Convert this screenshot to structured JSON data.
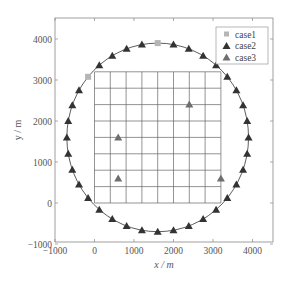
{
  "chart_data": {
    "type": "scatter",
    "title": "",
    "xlabel": "x / m",
    "ylabel": "y / m",
    "xlim": [
      -1000,
      4500
    ],
    "ylim": [
      -1000,
      4500
    ],
    "xticks": [
      -1000,
      0,
      1000,
      2000,
      3000,
      4000
    ],
    "yticks": [
      -1000,
      0,
      1000,
      2000,
      3000,
      4000
    ],
    "xtick_labels": [
      "−1000",
      "0",
      "1000",
      "2000",
      "3000",
      "4000"
    ],
    "ytick_labels": [
      "−1000",
      "0",
      "1000",
      "2000",
      "3000",
      "4000"
    ],
    "grid": {
      "region": {
        "x": [
          0,
          3200
        ],
        "y": [
          0,
          3200
        ]
      },
      "spacing": 400
    },
    "circle": {
      "center": [
        1600,
        1600
      ],
      "radius": 2300
    },
    "legend_position": "upper right",
    "series": [
      {
        "name": "case1",
        "marker": "square",
        "color": "#b5b5b5",
        "points": [
          [
            1600,
            3900
          ],
          [
            -162,
            3078
          ]
        ]
      },
      {
        "name": "case2",
        "marker": "triangle",
        "color": "#333333",
        "angles_deg": [
          0,
          10,
          20,
          30,
          40,
          50,
          60,
          70,
          80,
          100,
          110,
          120,
          130,
          150,
          160,
          170,
          180,
          190,
          200,
          210,
          220,
          230,
          240,
          250,
          260,
          270,
          280,
          290,
          300,
          310,
          320,
          330,
          340,
          350
        ],
        "note": "points on circle center (1600,1600) radius 2300 at listed angles"
      },
      {
        "name": "case3",
        "marker": "triangle",
        "color": "#6e6e6e",
        "points": [
          [
            600,
            1600
          ],
          [
            600,
            600
          ],
          [
            2400,
            2400
          ],
          [
            3200,
            600
          ]
        ]
      }
    ]
  }
}
